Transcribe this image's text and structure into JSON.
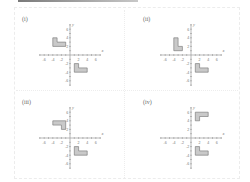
{
  "page": {
    "colors": {
      "axis": "#8a8a8a",
      "shape_fill": "#c9c9c9",
      "shape_stroke": "#707070",
      "text": "#777777"
    }
  },
  "panels": [
    {
      "label": "(i)",
      "x_axis_label": "x",
      "y_axis_label": "y",
      "x_ticks": [
        "-6",
        "-4",
        "-2",
        "2",
        "4",
        "6"
      ],
      "y_ticks": [
        "6",
        "4",
        "2",
        "-2",
        "-4",
        "-6"
      ],
      "shapes": [
        {
          "name": "object",
          "points": [
            [
              -4,
              2
            ],
            [
              -4,
              4
            ],
            [
              -3,
              4
            ],
            [
              -3,
              3
            ],
            [
              -1,
              3
            ],
            [
              -1,
              2
            ]
          ]
        },
        {
          "name": "image",
          "points": [
            [
              1,
              -4
            ],
            [
              1,
              -2
            ],
            [
              2,
              -2
            ],
            [
              2,
              -3
            ],
            [
              4,
              -3
            ],
            [
              4,
              -4
            ]
          ]
        }
      ]
    },
    {
      "label": "(ii)",
      "x_axis_label": "x",
      "y_axis_label": "y",
      "x_ticks": [
        "-6",
        "-4",
        "-2",
        "2",
        "4",
        "6"
      ],
      "y_ticks": [
        "6",
        "4",
        "2",
        "-2",
        "-4",
        "-6"
      ],
      "shapes": [
        {
          "name": "object",
          "points": [
            [
              -4,
              1
            ],
            [
              -4,
              4
            ],
            [
              -3,
              4
            ],
            [
              -3,
              2
            ],
            [
              -2,
              2
            ],
            [
              -2,
              1
            ]
          ]
        },
        {
          "name": "image",
          "points": [
            [
              1,
              -4
            ],
            [
              1,
              -2
            ],
            [
              2,
              -2
            ],
            [
              2,
              -3
            ],
            [
              4,
              -3
            ],
            [
              4,
              -4
            ]
          ]
        }
      ]
    },
    {
      "label": "(iii)",
      "x_axis_label": "x",
      "y_axis_label": "y",
      "x_ticks": [
        "-6",
        "-4",
        "-2",
        "2",
        "4",
        "6"
      ],
      "y_ticks": [
        "6",
        "4",
        "2",
        "-2",
        "-4",
        "-6"
      ],
      "shapes": [
        {
          "name": "object",
          "points": [
            [
              -4,
              3
            ],
            [
              -4,
              4
            ],
            [
              -1,
              4
            ],
            [
              -1,
              2
            ],
            [
              -2,
              2
            ],
            [
              -2,
              3
            ]
          ]
        },
        {
          "name": "image",
          "points": [
            [
              1,
              -4
            ],
            [
              1,
              -2
            ],
            [
              2,
              -2
            ],
            [
              2,
              -3
            ],
            [
              4,
              -3
            ],
            [
              4,
              -4
            ]
          ]
        }
      ]
    },
    {
      "label": "(iv)",
      "x_axis_label": "x",
      "y_axis_label": "y",
      "x_ticks": [
        "-6",
        "-4",
        "-2",
        "2",
        "4",
        "6"
      ],
      "y_ticks": [
        "6",
        "4",
        "2",
        "-2",
        "-4",
        "-6"
      ],
      "shapes": [
        {
          "name": "object",
          "points": [
            [
              1,
              4
            ],
            [
              1,
              6
            ],
            [
              4,
              6
            ],
            [
              4,
              5
            ],
            [
              2,
              5
            ],
            [
              2,
              4
            ]
          ]
        },
        {
          "name": "image",
          "points": [
            [
              1,
              -4
            ],
            [
              1,
              -2
            ],
            [
              2,
              -2
            ],
            [
              2,
              -3
            ],
            [
              4,
              -3
            ],
            [
              4,
              -4
            ]
          ]
        }
      ]
    }
  ]
}
